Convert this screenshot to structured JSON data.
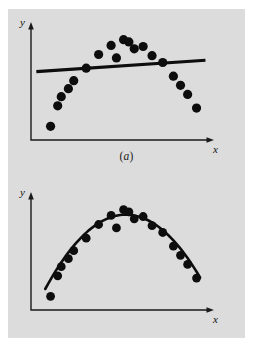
{
  "figure": {
    "background_color": "#ffffff",
    "panel_color": "#dcdcdc",
    "ink_color": "#0d0d0d",
    "width": 253,
    "height": 349
  },
  "panels": [
    {
      "id": "a",
      "caption": "(a)",
      "caption_letter": "a",
      "xlabel": "x",
      "ylabel": "y"
    },
    {
      "id": "b",
      "caption": "(b)",
      "caption_letter": "b",
      "xlabel": "x",
      "ylabel": "y"
    }
  ],
  "chart_data": [
    {
      "type": "scatter",
      "title": "(a)",
      "xlabel": "x",
      "ylabel": "y",
      "grid": false,
      "legend": null,
      "axis_ticks": false,
      "xlim": [
        0,
        100
      ],
      "ylim": [
        0,
        100
      ],
      "description": "Scatter of parabolic data with an inappropriate straight-line least-squares fit; residuals show systematic curvature.",
      "series": [
        {
          "name": "observations",
          "marker": "filled-circle",
          "marker_color": "#0d0d0d",
          "x": [
            11,
            17,
            15,
            21,
            24,
            31,
            38,
            45,
            48,
            52,
            55,
            58,
            63,
            68,
            74,
            80,
            84,
            88,
            93
          ],
          "y": [
            12,
            38,
            30,
            45,
            52,
            63,
            75,
            83,
            72,
            88,
            86,
            80,
            82,
            74,
            68,
            56,
            48,
            40,
            28
          ]
        },
        {
          "name": "linear-fit",
          "type": "line",
          "color": "#0d0d0d",
          "x": [
            3,
            98
          ],
          "y": [
            60,
            70
          ]
        }
      ]
    },
    {
      "type": "scatter",
      "title": "(b)",
      "xlabel": "x",
      "ylabel": "y",
      "grid": false,
      "legend": null,
      "axis_ticks": false,
      "xlim": [
        0,
        100
      ],
      "ylim": [
        0,
        100
      ],
      "description": "Same scatter of parabolic data with an appropriate quadratic least-squares fit; points scatter randomly about the curve.",
      "series": [
        {
          "name": "observations",
          "marker": "filled-circle",
          "marker_color": "#0d0d0d",
          "x": [
            11,
            17,
            15,
            21,
            24,
            31,
            38,
            45,
            48,
            52,
            55,
            58,
            63,
            68,
            74,
            80,
            84,
            88,
            93
          ],
          "y": [
            12,
            38,
            30,
            45,
            52,
            63,
            75,
            83,
            72,
            88,
            86,
            80,
            82,
            74,
            68,
            56,
            48,
            40,
            28
          ]
        },
        {
          "name": "quadratic-fit",
          "type": "curve",
          "color": "#0d0d0d",
          "x": [
            8,
            25,
            50,
            75,
            95
          ],
          "y": [
            18,
            58,
            86,
            65,
            30
          ]
        }
      ]
    }
  ]
}
